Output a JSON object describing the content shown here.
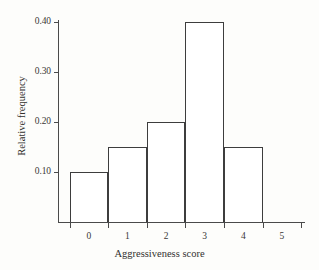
{
  "chart_data": {
    "type": "bar",
    "title": "",
    "subtitle": "",
    "xlabel": "Aggressiveness score",
    "ylabel": "Relative frequency",
    "categories": [
      "0",
      "1",
      "2",
      "3",
      "4",
      "5"
    ],
    "values": [
      0.1,
      0.15,
      0.2,
      0.4,
      0.15,
      0.0
    ],
    "series": [
      {
        "name": "Relative frequency",
        "values": [
          0.1,
          0.15,
          0.2,
          0.4,
          0.15,
          0.0
        ]
      }
    ],
    "xlim": [
      -0.8,
      5.6
    ],
    "ylim": [
      0.0,
      0.42
    ],
    "x_tick_labels": [
      "0",
      "1",
      "2",
      "3",
      "4",
      "5"
    ],
    "x_tick_values": [
      0,
      1,
      2,
      3,
      4,
      5
    ],
    "x_bin_edges": [
      -0.5,
      0.5,
      1.5,
      2.5,
      3.5,
      4.5,
      5.5
    ],
    "y_tick_labels": [
      "0.10",
      "0.20",
      "0.30",
      "0.40"
    ],
    "y_tick_values": [
      0.1,
      0.2,
      0.3,
      0.4
    ],
    "grid": false,
    "legend": false,
    "legend_position": "none",
    "bar_fill_color": "#ffffff",
    "bar_edge_color": "#3d3d3d",
    "axis_color": "#4a4a4a",
    "background_color": "#fdfdfb",
    "annotations": []
  }
}
